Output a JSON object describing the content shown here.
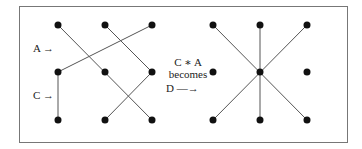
{
  "labels": {
    "a_arrow": "A →",
    "c_arrow": "C →",
    "mid_line1": "C ∗ A",
    "mid_line2": "becomes",
    "mid_line3": "D —→"
  },
  "left_grid": {
    "dots": [
      [
        58,
        25
      ],
      [
        105,
        25
      ],
      [
        152,
        25
      ],
      [
        58,
        72
      ],
      [
        105,
        72
      ],
      [
        152,
        72
      ],
      [
        58,
        120
      ],
      [
        105,
        120
      ],
      [
        152,
        120
      ]
    ],
    "edges": [
      [
        [
          58,
          25
        ],
        [
          152,
          120
        ]
      ],
      [
        [
          105,
          25
        ],
        [
          152,
          72
        ]
      ],
      [
        [
          152,
          25
        ],
        [
          58,
          72
        ]
      ],
      [
        [
          58,
          72
        ],
        [
          58,
          120
        ]
      ],
      [
        [
          152,
          72
        ],
        [
          105,
          120
        ]
      ]
    ]
  },
  "right_grid": {
    "dots": [
      [
        213,
        25
      ],
      [
        260,
        25
      ],
      [
        307,
        25
      ],
      [
        213,
        72
      ],
      [
        260,
        72
      ],
      [
        307,
        72
      ],
      [
        213,
        120
      ],
      [
        260,
        120
      ],
      [
        307,
        120
      ]
    ],
    "edges": [
      [
        [
          213,
          25
        ],
        [
          307,
          120
        ]
      ],
      [
        [
          307,
          25
        ],
        [
          213,
          120
        ]
      ],
      [
        [
          260,
          25
        ],
        [
          260,
          120
        ]
      ]
    ]
  },
  "colors": {
    "dot": "#111111",
    "line": "#555555",
    "frame": "#777777"
  }
}
